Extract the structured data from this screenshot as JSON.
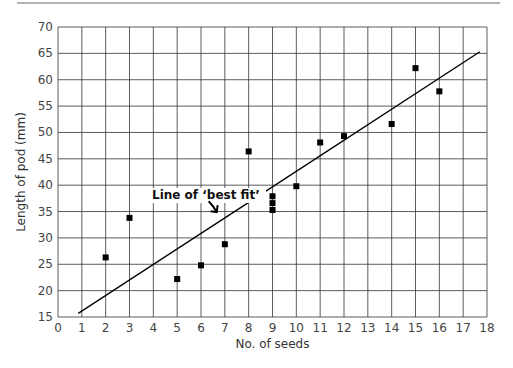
{
  "chart_data": {
    "type": "scatter",
    "title": "",
    "xlabel": "No. of seeds",
    "ylabel": "Length of pod (mm)",
    "xlim": [
      0,
      18
    ],
    "ylim": [
      15,
      70
    ],
    "xticks": [
      0,
      1,
      2,
      3,
      4,
      5,
      6,
      7,
      8,
      9,
      10,
      11,
      12,
      13,
      14,
      15,
      16,
      17,
      18
    ],
    "yticks": [
      15,
      20,
      25,
      30,
      35,
      40,
      45,
      50,
      55,
      60,
      65,
      70
    ],
    "grid": true,
    "series": [
      {
        "name": "pods",
        "marker": "square",
        "points": [
          {
            "x": 2,
            "y": 26.3
          },
          {
            "x": 3,
            "y": 33.8
          },
          {
            "x": 5,
            "y": 22.2
          },
          {
            "x": 6,
            "y": 24.8
          },
          {
            "x": 7,
            "y": 28.8
          },
          {
            "x": 8,
            "y": 46.4
          },
          {
            "x": 9,
            "y": 37.9
          },
          {
            "x": 9,
            "y": 36.6
          },
          {
            "x": 9,
            "y": 35.3
          },
          {
            "x": 10,
            "y": 39.8
          },
          {
            "x": 11,
            "y": 48.1
          },
          {
            "x": 12,
            "y": 49.3
          },
          {
            "x": 14,
            "y": 51.6
          },
          {
            "x": 15,
            "y": 62.2
          },
          {
            "x": 16,
            "y": 57.8
          }
        ]
      }
    ],
    "best_fit_line": {
      "x1": 0.85,
      "y1": 15.7,
      "x2": 17.7,
      "y2": 65.3
    },
    "annotations": [
      {
        "text": "Line of ‘best fit’",
        "arrow_to": {
          "x": 6.7,
          "y": 34.5
        }
      }
    ]
  },
  "colors": {
    "grid": "#333333",
    "marker": "#000000",
    "line": "#000000",
    "header_rule": "#666666"
  }
}
